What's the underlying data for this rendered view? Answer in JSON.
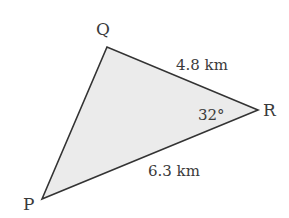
{
  "diagram": {
    "type": "triangle",
    "fill_color": "#ebebeb",
    "stroke_color": "#333333",
    "vertices": {
      "P": {
        "label": "P",
        "x": 42,
        "y": 199
      },
      "Q": {
        "label": "Q",
        "x": 107,
        "y": 47
      },
      "R": {
        "label": "R",
        "x": 258,
        "y": 110
      }
    },
    "sides": {
      "QR": {
        "label": "4.8 km"
      },
      "PR": {
        "label": "6.3 km"
      }
    },
    "angles": {
      "R": {
        "label": "32°"
      }
    }
  }
}
